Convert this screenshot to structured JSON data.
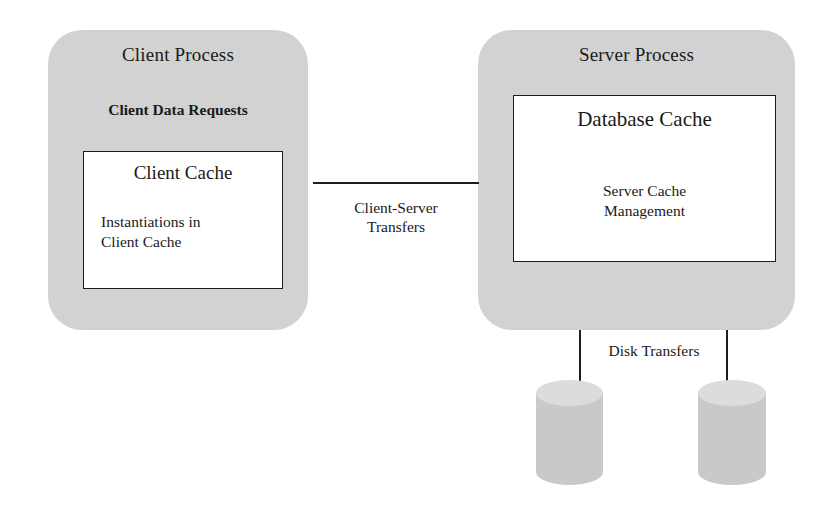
{
  "diagram": {
    "colors": {
      "process_fill": "#d2d2d2",
      "cache_fill": "#ffffff",
      "stroke": "#1d1d1d",
      "cylinder_body": "#c9c9c9",
      "cylinder_top": "#dcdcdc",
      "background": "#ffffff"
    }
  },
  "client_process": {
    "title": "Client Process",
    "subtitle": "Client Data Requests",
    "cache": {
      "title": "Client Cache",
      "body_line_1": "Instantiations in",
      "body_line_2": "Client Cache"
    }
  },
  "server_process": {
    "title": "Server Process",
    "cache": {
      "title": "Database Cache",
      "body_line_1": "Server Cache",
      "body_line_2": "Management"
    }
  },
  "connectors": {
    "client_server": {
      "label_line_1": "Client-Server",
      "label_line_2": "Transfers"
    },
    "disk": {
      "label": "Disk Transfers"
    }
  },
  "disks": [
    {
      "name": "disk-1"
    },
    {
      "name": "disk-2"
    }
  ]
}
